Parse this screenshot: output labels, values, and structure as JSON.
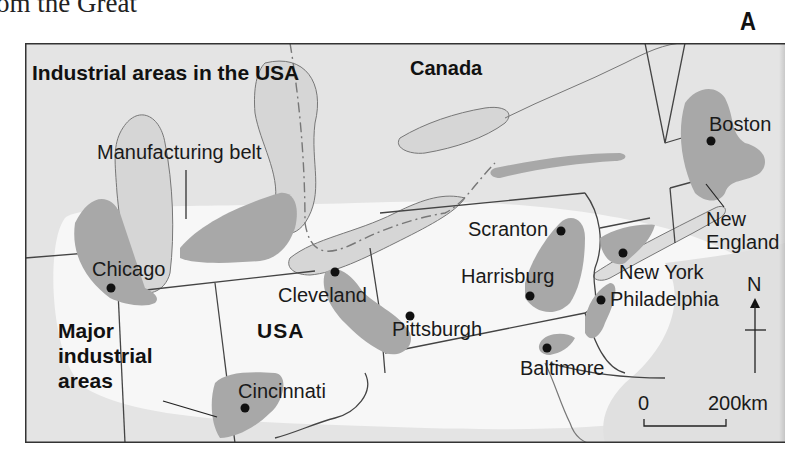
{
  "page": {
    "caption_fragment": "om the Great",
    "figure_letter": "A"
  },
  "map": {
    "title": "Industrial areas in the USA",
    "country_labels": {
      "canada": "Canada",
      "usa": "USA"
    },
    "region_labels": {
      "manufacturing_belt": "Manufacturing belt",
      "new_england_line1": "New",
      "new_england_line2": "England"
    },
    "legend": {
      "line1": "Major",
      "line2": "industrial",
      "line3": "areas"
    },
    "cities": [
      {
        "name": "Chicago"
      },
      {
        "name": "Cleveland"
      },
      {
        "name": "Pittsburgh"
      },
      {
        "name": "Cincinnati"
      },
      {
        "name": "Scranton"
      },
      {
        "name": "Harrisburg"
      },
      {
        "name": "Baltimore"
      },
      {
        "name": "Philadelphia"
      },
      {
        "name": "New York"
      },
      {
        "name": "Boston"
      }
    ],
    "north_arrow": {
      "label": "N"
    },
    "scale_bar": {
      "start": "0",
      "end": "200km"
    },
    "colors": {
      "land_background": "#e6e6e6",
      "belt": "#f7f7f7",
      "industrial_area": "#a8a8a8",
      "water": "#d9d9d9",
      "border": "#444444"
    }
  }
}
